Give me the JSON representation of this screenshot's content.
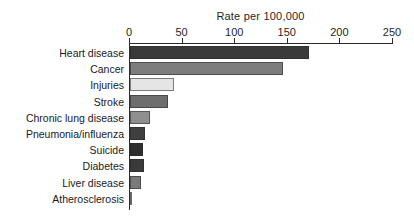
{
  "chart_data": {
    "type": "bar",
    "orientation": "horizontal",
    "title": "Rate per 100,000",
    "xlabel": "Rate per 100,000",
    "ylabel": "",
    "xlim": [
      0,
      250
    ],
    "xticks": [
      0,
      50,
      100,
      150,
      200,
      250
    ],
    "grid": false,
    "legend": null,
    "categories": [
      "Heart disease",
      "Cancer",
      "Injuries",
      "Stroke",
      "Chronic lung disease",
      "Pneumonia/influenza",
      "Suicide",
      "Diabetes",
      "Liver disease",
      "Atherosclerosis"
    ],
    "values": [
      170,
      145,
      42,
      36,
      19,
      14,
      12,
      13,
      10,
      2
    ],
    "bar_colors": [
      "#3a3a3a",
      "#7d7d7d",
      "#e5e5e5",
      "#6e6e6e",
      "#8f8f8f",
      "#3f3f3f",
      "#2e2e2e",
      "#3a3a3a",
      "#7a7a7a",
      "#b5b5b5"
    ]
  },
  "axis": {
    "tick_labels": [
      "0",
      "50",
      "100",
      "150",
      "200",
      "250"
    ]
  },
  "colors": {
    "axis": "#2b2b2b",
    "text": "#1a1a1a",
    "background": "#ffffff"
  }
}
